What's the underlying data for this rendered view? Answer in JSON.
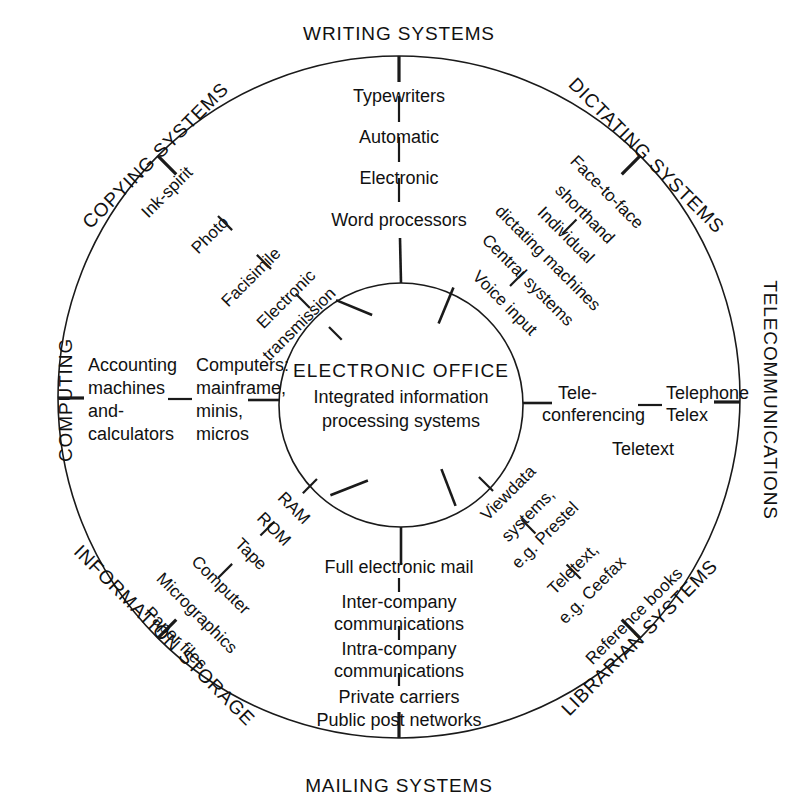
{
  "diagram": {
    "type": "radial-concentric-wheel",
    "title": "ELECTRONIC OFFICE",
    "hub": {
      "title": "ELECTRONIC OFFICE",
      "line2": "Integrated information",
      "line3": "processing systems"
    },
    "colors": {
      "stroke": "#1a1a1a",
      "text": "#111111",
      "background": "#ffffff"
    },
    "sectors": [
      {
        "id": "writing",
        "label": "WRITING SYSTEMS"
      },
      {
        "id": "dictating",
        "label": "DICTATING SYSTEMS"
      },
      {
        "id": "telecommunications",
        "label": "TELECOMMUNICATIONS"
      },
      {
        "id": "librarian",
        "label": "LIBRARIAN SYSTEMS"
      },
      {
        "id": "mailing",
        "label": "MAILING SYSTEMS"
      },
      {
        "id": "information_storage",
        "label": "INFORMATION STORAGE"
      },
      {
        "id": "computing",
        "label": "COMPUTING"
      },
      {
        "id": "copying",
        "label": "COPYING SYSTEMS"
      }
    ],
    "nodes": {
      "writing": [
        "Typewriters",
        "Automatic",
        "Electronic",
        "Word processors"
      ],
      "dictating": [
        "Face-to-face",
        "shorthand",
        "Individual",
        "dictating machines",
        "Central systems",
        "Voice input"
      ],
      "telecommunications": [
        "Telephone",
        "Telex",
        "Tele-",
        "conferencing",
        "Teletext"
      ],
      "librarian": [
        "Viewdata",
        "systems,",
        "e.g. Prestel",
        "Teletext,",
        "e.g. Ceefax",
        "Reference books"
      ],
      "mailing": [
        "Full electronic mail",
        "Inter-company",
        "communications",
        "Intra-company",
        "communications",
        "Private carriers",
        "Public post networks"
      ],
      "information_storage": [
        "RAM",
        "ROM",
        "Tape",
        "Computer",
        "Micrographics",
        "Paper files"
      ],
      "computing": [
        "Accounting",
        "machines",
        "and-",
        "calculators",
        "Computers:",
        "mainframe,",
        "minis,",
        "micros"
      ],
      "copying": [
        "Ink-spirit",
        "Photo",
        "Facisimile",
        "Electronic",
        "transmission"
      ]
    }
  }
}
